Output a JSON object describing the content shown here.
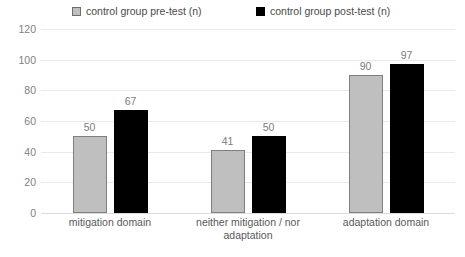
{
  "chart_data": {
    "type": "bar",
    "title": "",
    "subtitle": "",
    "xlabel": "",
    "ylabel": "",
    "ylim": [
      0,
      120
    ],
    "yticks": [
      0,
      20,
      40,
      60,
      80,
      100,
      120
    ],
    "grid": true,
    "legend_position": "top",
    "categories": [
      "mitigation domain",
      "neither mitigation / nor adaptation",
      "adaptation domain"
    ],
    "category_lines": [
      [
        "mitigation domain"
      ],
      [
        "neither mitigation / nor",
        "adaptation"
      ],
      [
        "adaptation domain"
      ]
    ],
    "series": [
      {
        "name": "control group pre-test (n)",
        "color": "#BFBFBF",
        "border_color": "#7F7F7F",
        "values": [
          50,
          41,
          90
        ]
      },
      {
        "name": "control group post-test (n)",
        "color": "#000000",
        "border_color": "#000000",
        "values": [
          67,
          50,
          97
        ]
      }
    ],
    "data_labels": [
      [
        50,
        41,
        90
      ],
      [
        67,
        50,
        97
      ]
    ],
    "data_label_color": "#7C7C7C",
    "axis_label_color": "#808080",
    "gridline_color": "#E9E9E9",
    "background": "#FFFFFF"
  }
}
